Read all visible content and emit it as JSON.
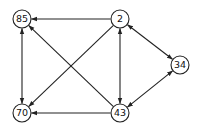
{
  "graph": {
    "type": "directed",
    "nodes": [
      {
        "id": "85",
        "label": "85",
        "x": 22,
        "y": 19
      },
      {
        "id": "2",
        "label": "2",
        "x": 120,
        "y": 19
      },
      {
        "id": "34",
        "label": "34",
        "x": 180,
        "y": 65
      },
      {
        "id": "70",
        "label": "70",
        "x": 22,
        "y": 113
      },
      {
        "id": "43",
        "label": "43",
        "x": 120,
        "y": 113
      }
    ],
    "edges": [
      {
        "from": "2",
        "to": "85",
        "bidirectional": false
      },
      {
        "from": "2",
        "to": "70",
        "bidirectional": false
      },
      {
        "from": "2",
        "to": "43",
        "bidirectional": true
      },
      {
        "from": "2",
        "to": "34",
        "bidirectional": true
      },
      {
        "from": "43",
        "to": "34",
        "bidirectional": true
      },
      {
        "from": "43",
        "to": "85",
        "bidirectional": false
      },
      {
        "from": "43",
        "to": "70",
        "bidirectional": false
      },
      {
        "from": "85",
        "to": "70",
        "bidirectional": true
      }
    ],
    "node_radius": 9,
    "stroke_color": "#222222"
  }
}
